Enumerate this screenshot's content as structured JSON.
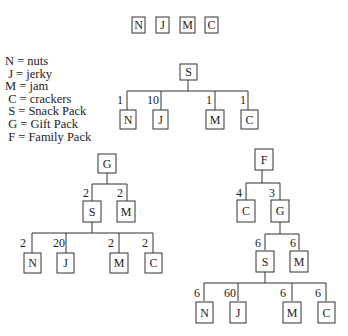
{
  "top_text_cutoff": "",
  "items_row": [
    "N",
    "J",
    "M",
    "C"
  ],
  "legend": [
    {
      "key": "N",
      "text": "N = nuts"
    },
    {
      "key": "J",
      "text": " J = jerky"
    },
    {
      "key": "M",
      "text": "M = jam"
    },
    {
      "key": "C",
      "text": " C = crackers"
    },
    {
      "key": "S",
      "text": " S = Snack Pack"
    },
    {
      "key": "G",
      "text": " G = Gift Pack"
    },
    {
      "key": "F",
      "text": " F = Family Pack"
    }
  ],
  "trees": {
    "snack_pack": {
      "root": "S",
      "children": [
        {
          "node": "N",
          "qty": "1"
        },
        {
          "node": "J",
          "qty": "10"
        },
        {
          "node": "M",
          "qty": "1"
        },
        {
          "node": "C",
          "qty": "1"
        }
      ]
    },
    "gift_pack": {
      "root": "G",
      "children": [
        {
          "node": "S",
          "qty": "2",
          "children": [
            {
              "node": "N",
              "qty": "2"
            },
            {
              "node": "J",
              "qty": "20"
            },
            {
              "node": "M",
              "qty": "2"
            },
            {
              "node": "C",
              "qty": "2"
            }
          ]
        },
        {
          "node": "M",
          "qty": "2"
        }
      ]
    },
    "family_pack": {
      "root": "F",
      "children": [
        {
          "node": "C",
          "qty": "4"
        },
        {
          "node": "G",
          "qty": "3",
          "children": [
            {
              "node": "S",
              "qty": "6",
              "children": [
                {
                  "node": "N",
                  "qty": "6"
                },
                {
                  "node": "J",
                  "qty": "60"
                },
                {
                  "node": "M",
                  "qty": "6"
                },
                {
                  "node": "C",
                  "qty": "6"
                }
              ]
            },
            {
              "node": "M",
              "qty": "6"
            }
          ]
        }
      ]
    }
  }
}
